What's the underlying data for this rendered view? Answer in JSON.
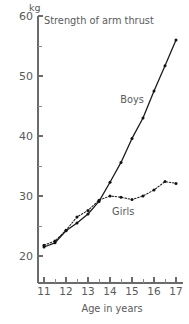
{
  "chart_data": {
    "type": "line",
    "title": "Strength of arm thrust",
    "xlabel": "Age in years",
    "ylabel": "kg",
    "unit": "kg",
    "xlim": [
      10.5,
      17.3
    ],
    "ylim": [
      16.0,
      60.0
    ],
    "xticks": [
      11,
      12,
      13,
      14,
      15,
      16,
      17
    ],
    "xtick_labels": [
      "11",
      "12",
      "13",
      "14",
      "15",
      "16",
      "17"
    ],
    "yticks": [
      20,
      30,
      40,
      50,
      60
    ],
    "ytick_labels": [
      "20",
      "30",
      "40",
      "50",
      "60"
    ],
    "yticks_minor": [
      25,
      35,
      45,
      55
    ],
    "xticks_minor": [
      11.5,
      12.5,
      13.5,
      14.5,
      15.5,
      16.5
    ],
    "grid": false,
    "legend_position": "inline-annotation",
    "series": [
      {
        "name": "Boys",
        "label": "Boys",
        "style": "solid",
        "marker": "dot",
        "x": [
          11.0,
          11.5,
          12.0,
          12.5,
          13.0,
          13.5,
          14.0,
          14.5,
          15.0,
          15.5,
          16.0,
          16.5,
          17.0
        ],
        "values": [
          21.5,
          22.2,
          24.2,
          25.5,
          27.0,
          29.1,
          32.3,
          35.6,
          39.6,
          43.0,
          47.5,
          51.7,
          56.0
        ]
      },
      {
        "name": "Girls",
        "label": "Girls",
        "style": "dotted",
        "marker": "dot",
        "x": [
          11.0,
          11.5,
          12.0,
          12.5,
          13.0,
          13.5,
          14.0,
          14.5,
          15.0,
          15.5,
          16.0,
          16.5,
          17.0
        ],
        "values": [
          21.8,
          22.5,
          24.3,
          26.5,
          27.6,
          29.3,
          30.0,
          29.8,
          29.4,
          30.0,
          31.0,
          32.4,
          32.1
        ]
      }
    ],
    "annotations": [
      {
        "text": "Boys",
        "x": 15.0,
        "y": 45.5
      },
      {
        "text": "Girls",
        "x": 14.6,
        "y": 26.8
      }
    ]
  }
}
